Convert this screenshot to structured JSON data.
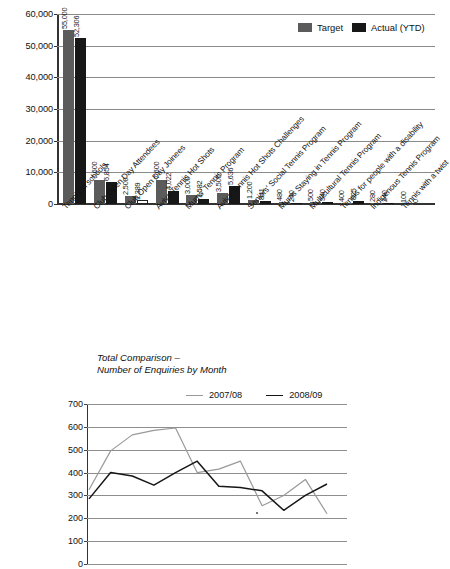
{
  "chart_data": [
    {
      "type": "bar",
      "title": "",
      "xlabel": "",
      "ylabel": "",
      "ylim": [
        0,
        60000
      ],
      "ytick_labels": [
        "0",
        "10,000",
        "20,000",
        "30,000",
        "40,000",
        "50,000",
        "60,000"
      ],
      "yticks": [
        0,
        10000,
        20000,
        30000,
        40000,
        50000,
        60000
      ],
      "grid": true,
      "legend_position": "top-right",
      "legend": [
        "Target",
        "Actual (YTD)"
      ],
      "colors": {
        "target": "#5b5b5b",
        "actual": "#171717",
        "hollow": "#ffffff"
      },
      "categories": [
        "Tennis in schools",
        "Club Open Day Attendees",
        "Club Open Day Joinees",
        "Aviva Tennis Hot Shots",
        "Mums' Tennis Program",
        "Aviva Tennis Hot Shots Challenges",
        "Seniors' Social Tennis Program",
        "Mums Staying in Tennis Program",
        "Multicultural Tennis Program",
        "Tennis for people with a disability",
        "Indigenous Tennis Program",
        "Tennis with a twist"
      ],
      "series": [
        {
          "name": "Target",
          "values": [
            55000,
            7600,
            2500,
            7600,
            3000,
            3500,
            1200,
            480,
            500,
            400,
            280,
            100
          ],
          "labels": [
            "55,000",
            "7,600",
            "2,500",
            "7,600",
            "3,000",
            "3,500",
            "1,200",
            "480",
            "500",
            "400",
            "280",
            "100"
          ]
        },
        {
          "name": "Actual (YTD)",
          "values": [
            52306,
            6854,
            1389,
            4022,
            1582,
            5636,
            841,
            240,
            540,
            825,
            240,
            0
          ],
          "labels": [
            "52,306",
            "6,854",
            "1,389",
            "4,022",
            "1,582",
            "5,636",
            "841",
            "240",
            "540",
            "825",
            "240",
            "0"
          ]
        }
      ]
    },
    {
      "type": "line",
      "title": "Total Comparison –\nNumber of Enquiries by Month",
      "xlabel": "",
      "ylabel": "",
      "ylim": [
        0,
        700
      ],
      "ytick_labels": [
        "0",
        "100",
        "200",
        "300",
        "400",
        "500",
        "600",
        "700"
      ],
      "yticks": [
        0,
        100,
        200,
        300,
        400,
        500,
        600,
        700
      ],
      "grid": true,
      "legend_position": "top-right",
      "legend": [
        "2007/08",
        "2008/09"
      ],
      "colors": {
        "y0708": "#999999",
        "y0809": "#161616"
      },
      "x": [
        1,
        2,
        3,
        4,
        5,
        6,
        7,
        8,
        9,
        10,
        11,
        12
      ],
      "series": [
        {
          "name": "2007/08",
          "values": [
            325,
            495,
            565,
            585,
            595,
            400,
            415,
            450,
            255,
            300,
            370,
            220
          ]
        },
        {
          "name": "2008/09",
          "values": [
            285,
            400,
            385,
            345,
            400,
            450,
            340,
            335,
            320,
            235,
            300,
            350
          ]
        }
      ]
    }
  ],
  "bar_chart": {
    "legend": [
      {
        "label": "Target",
        "swatch": "target"
      },
      {
        "label": "Actual (YTD)",
        "swatch": "actual"
      }
    ]
  },
  "line_chart": {
    "title": "Total Comparison –\nNumber of Enquiries by Month",
    "legend": [
      {
        "label": "2007/08",
        "swatch": "y0708"
      },
      {
        "label": "2008/09",
        "swatch": "y0809"
      }
    ]
  }
}
